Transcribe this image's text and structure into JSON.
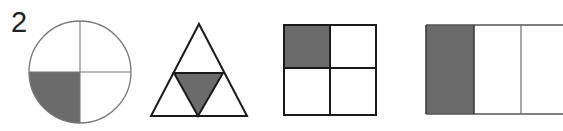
{
  "question_number": "2",
  "colors": {
    "shade": "#6b6b6b",
    "stroke": "#1a1a1a",
    "light_stroke": "#888888",
    "background": "#ffffff"
  },
  "figures": [
    {
      "id": "circle",
      "shape": "circle",
      "parts": 4,
      "shaded": 1,
      "shaded_part": "bottom-left quarter"
    },
    {
      "id": "triangle",
      "shape": "triangle",
      "parts": 4,
      "shaded": 1,
      "shaded_part": "center inverted triangle"
    },
    {
      "id": "square",
      "shape": "square",
      "parts": 4,
      "shaded": 1,
      "shaded_part": "top-left quarter"
    },
    {
      "id": "rectangle",
      "shape": "rectangle",
      "parts": 3,
      "shaded": 1,
      "shaded_part": "left third"
    }
  ]
}
